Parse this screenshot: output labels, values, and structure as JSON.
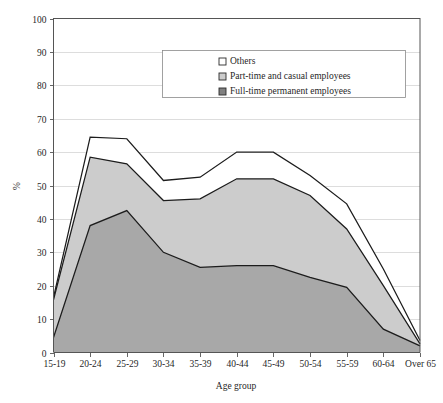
{
  "chart_data": {
    "type": "area",
    "stacked": true,
    "title": "",
    "xlabel": "Age group",
    "ylabel": "%",
    "categories": [
      "15-19",
      "20-24",
      "25-29",
      "30-34",
      "35-39",
      "40-44",
      "45-49",
      "50-54",
      "55-59",
      "60-64",
      "Over 65"
    ],
    "ylim": [
      0,
      100
    ],
    "yticks": [
      0,
      10,
      20,
      30,
      40,
      50,
      60,
      70,
      80,
      90,
      100
    ],
    "ytick_labels": [
      "0",
      "10",
      "20",
      "30",
      "40",
      "50",
      "60",
      "70",
      "80",
      "90",
      "100"
    ],
    "grid": true,
    "legend_position": "top-center-inside",
    "series": [
      {
        "name": "Full-time permanent employees",
        "color": "#a8a8a8",
        "values": [
          4.5,
          38,
          42.5,
          30,
          25.5,
          26,
          26,
          22.5,
          19.5,
          7,
          2
        ]
      },
      {
        "name": "Part-time and casual employees",
        "color": "#cccccc",
        "values": [
          11.3,
          20.5,
          14,
          15.5,
          20.5,
          26,
          26,
          24.5,
          17.5,
          13,
          0.6
        ]
      },
      {
        "name": "Others",
        "color": "#ffffff",
        "values": [
          0.7,
          6,
          7.5,
          6,
          6.5,
          8,
          8,
          6,
          7.5,
          5,
          1
        ]
      }
    ],
    "cumulative": {
      "full_time": [
        4.5,
        38,
        42.5,
        30,
        25.5,
        26,
        26,
        22.5,
        19.5,
        7,
        2
      ],
      "full_plus_part": [
        15.8,
        58.5,
        56.5,
        45.5,
        46,
        52,
        52,
        47,
        37,
        20,
        2.6
      ],
      "total": [
        16.5,
        64.5,
        64,
        51.5,
        52.5,
        60,
        60,
        53,
        44.5,
        25,
        3.6
      ]
    }
  },
  "legend": {
    "items": [
      {
        "label": "Others",
        "swatch": "#ffffff"
      },
      {
        "label": "Part-time and casual employees",
        "swatch": "#cccccc"
      },
      {
        "label": "Full-time permanent employees",
        "swatch": "#808080"
      }
    ]
  },
  "axes": {
    "y_title": "%",
    "x_title": "Age group"
  }
}
